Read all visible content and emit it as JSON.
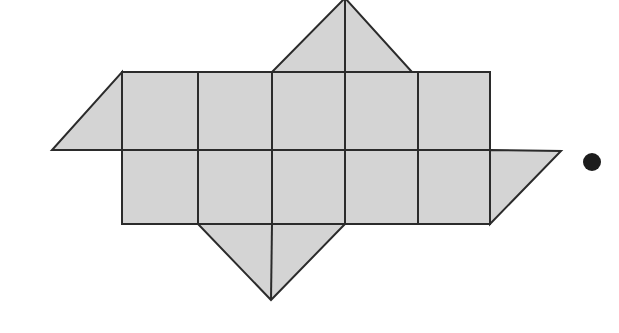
{
  "figure": {
    "kind": "polyhedron-net-diagram",
    "canvas": {
      "width": 619,
      "height": 333,
      "background": "#ffffff"
    },
    "style": {
      "fill": "#d4d4d4",
      "stroke": "#2b2b2b",
      "stroke_width": 2,
      "dot_color": "#1c1c1c"
    },
    "grid": {
      "columns": 5,
      "rows": 2,
      "x_lines": [
        122,
        198,
        272,
        345,
        418,
        490
      ],
      "y_lines": [
        72,
        150,
        224
      ],
      "cell_width": 74,
      "cell_height": 76
    },
    "squares": [
      {
        "name": "square-r1c1",
        "points": "122,72 198,72 198,150 122,150"
      },
      {
        "name": "square-r1c2",
        "points": "198,72 272,72 272,150 198,150"
      },
      {
        "name": "square-r1c3",
        "points": "272,72 345,72 345,150 272,150"
      },
      {
        "name": "square-r1c4",
        "points": "345,72 418,72 418,150 345,150"
      },
      {
        "name": "square-r1c5",
        "points": "418,72 490,72 490,150 418,150"
      },
      {
        "name": "square-r2c1",
        "points": "122,150 198,150 198,224 122,224"
      },
      {
        "name": "square-r2c2",
        "points": "198,150 272,150 272,224 198,224"
      },
      {
        "name": "square-r2c3",
        "points": "272,150 345,150 345,224 272,224"
      },
      {
        "name": "square-r2c4",
        "points": "345,150 418,150 418,224 345,224"
      },
      {
        "name": "square-r2c5",
        "points": "418,150 490,150 490,224 418,224"
      }
    ],
    "triangles": [
      {
        "name": "triangle-left",
        "points": "122,72 122,150 52,150"
      },
      {
        "name": "triangle-top",
        "points": "272,72 412,72 345,-2"
      },
      {
        "name": "triangle-right",
        "points": "490,150 561,151 490,224"
      },
      {
        "name": "triangle-bottom",
        "points": "198,224 345,224 271,300"
      }
    ],
    "interior_lines": [
      {
        "name": "grid-line-vertical-1",
        "x1": 198,
        "y1": 72,
        "x2": 198,
        "y2": 224
      },
      {
        "name": "grid-line-vertical-2",
        "x1": 272,
        "y1": 72,
        "x2": 272,
        "y2": 224
      },
      {
        "name": "grid-line-vertical-3",
        "x1": 345,
        "y1": 72,
        "x2": 345,
        "y2": 224
      },
      {
        "name": "grid-line-vertical-4",
        "x1": 418,
        "y1": 72,
        "x2": 418,
        "y2": 224
      },
      {
        "name": "grid-line-horizontal-middle",
        "x1": 122,
        "y1": 150,
        "x2": 490,
        "y2": 150
      },
      {
        "name": "fold-line-top-triangle",
        "x1": 345,
        "y1": -2,
        "x2": 345,
        "y2": 72
      },
      {
        "name": "fold-line-bottom-triangle",
        "x1": 271,
        "y1": 300,
        "x2": 272,
        "y2": 224
      }
    ],
    "marker_dot": {
      "name": "marker-dot",
      "cx": 592,
      "cy": 162,
      "r": 9
    }
  }
}
